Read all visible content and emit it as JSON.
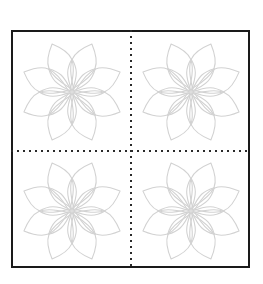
{
  "document": {
    "title": "Quilting Block Pattern",
    "kind": "line-art-template",
    "background_color": "#ffffff",
    "width": 263,
    "height": 284
  },
  "border": {
    "name": "block-outline",
    "shape": "square",
    "x": 11,
    "y": 30,
    "width": 239,
    "height": 238,
    "stroke_color": "#1a1a1a",
    "stroke_width": 2,
    "fill_color": "#ffffff"
  },
  "guides": {
    "stroke_color": "#2a2a2a",
    "dot_size": 2,
    "dot_gap": 4,
    "vertical": {
      "name": "vertical-center-guide",
      "x": 131,
      "y1": 30,
      "y2": 268
    },
    "horizontal": {
      "name": "horizontal-center-guide",
      "y": 151,
      "x1": 11,
      "x2": 250
    }
  },
  "motif": {
    "name": "eight-petal-flower",
    "stroke_color": "#d2d2d2",
    "stroke_width": 1.1,
    "fill": "none",
    "petal_count": 8,
    "outer_petal": {
      "length": 52,
      "half_width": 17,
      "inner_offset": 4
    },
    "inner_petal": {
      "length": 33,
      "half_width": 6,
      "inner_offset": 1
    },
    "outer_rotation_offset_deg": 22.5,
    "inner_rotation_offset_deg": 0
  },
  "flowers": [
    {
      "name": "flower-top-left",
      "quadrant": "top-left",
      "cx": 72,
      "cy": 92
    },
    {
      "name": "flower-top-right",
      "quadrant": "top-right",
      "cx": 191,
      "cy": 92
    },
    {
      "name": "flower-bottom-left",
      "quadrant": "bottom-left",
      "cx": 72,
      "cy": 211
    },
    {
      "name": "flower-bottom-right",
      "quadrant": "bottom-right",
      "cx": 191,
      "cy": 211
    }
  ]
}
